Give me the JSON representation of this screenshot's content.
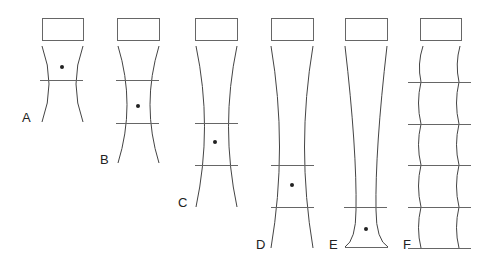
{
  "figure": {
    "colors": {
      "line": "#444444",
      "marker_line": "#666666",
      "box_stroke": "#666666",
      "dot": "#222222",
      "label": "#222222",
      "background": "#ffffff"
    },
    "panels": [
      {
        "id": "A",
        "label": "A",
        "label_pos": [
          22,
          122
        ],
        "box": [
          42,
          18,
          41,
          22
        ],
        "curve_left": "M42,46 Q56,84 42,122",
        "curve_right": "M83,46 Q69,84 83,122",
        "lines": [
          {
            "x1": 40,
            "x2": 83,
            "y": 80
          }
        ],
        "dot": [
          62,
          67
        ]
      },
      {
        "id": "B",
        "label": "B",
        "label_pos": [
          100,
          164
        ],
        "box": [
          117,
          18,
          42,
          22
        ],
        "curve_left": "M118,46 Q136,105 118,163",
        "curve_right": "M159,46 Q141,105 159,163",
        "lines": [
          {
            "x1": 116,
            "x2": 159,
            "y": 80
          },
          {
            "x1": 116,
            "x2": 159,
            "y": 123
          }
        ],
        "dot": [
          138,
          106
        ]
      },
      {
        "id": "C",
        "label": "C",
        "label_pos": [
          178,
          207
        ],
        "box": [
          195,
          18,
          42,
          22
        ],
        "curve_left": "M196,46 Q213,127 196,207",
        "curve_right": "M237,46 Q220,127 237,207",
        "lines": [
          {
            "x1": 195,
            "x2": 238,
            "y": 123
          },
          {
            "x1": 195,
            "x2": 238,
            "y": 165
          }
        ],
        "dot": [
          215,
          142
        ]
      },
      {
        "id": "D",
        "label": "D",
        "label_pos": [
          256,
          249
        ],
        "box": [
          271,
          18,
          42,
          22
        ],
        "curve_left": "M271,46 Q288,147 271,248",
        "curve_right": "M313,46 Q296,147 313,248",
        "lines": [
          {
            "x1": 271,
            "x2": 314,
            "y": 165
          },
          {
            "x1": 271,
            "x2": 314,
            "y": 207
          }
        ],
        "dot": [
          292,
          185
        ]
      },
      {
        "id": "E",
        "label": "E",
        "label_pos": [
          329,
          249
        ],
        "box": [
          345,
          18,
          42,
          22
        ],
        "curve_left": "M345,46 Q357,150 356,210 Q356,240 345,247",
        "curve_right": "M387,46 Q375,150 376,210 Q376,240 388,247",
        "lines": [
          {
            "x1": 344,
            "x2": 387,
            "y": 207
          },
          {
            "x1": 345,
            "x2": 388,
            "y": 247
          }
        ],
        "dot": [
          366,
          229
        ]
      },
      {
        "id": "F",
        "label": "F",
        "label_pos": [
          403,
          249
        ],
        "box": [
          420,
          18,
          41,
          22
        ],
        "curve_left": "M423,46 Q417,64 421,82 Q416,103 421,124 Q416,145 421,165 Q416,186 421,207 Q416,228 421,248",
        "curve_right": "M460,46 Q455,64 459,82 Q454,103 459,124 Q454,145 459,165 Q454,186 459,207 Q454,228 459,248",
        "lines": [
          {
            "x1": 408,
            "x2": 471,
            "y": 82
          },
          {
            "x1": 408,
            "x2": 471,
            "y": 124
          },
          {
            "x1": 408,
            "x2": 471,
            "y": 165
          },
          {
            "x1": 408,
            "x2": 471,
            "y": 207
          },
          {
            "x1": 408,
            "x2": 471,
            "y": 248
          }
        ],
        "dot": null
      }
    ]
  }
}
